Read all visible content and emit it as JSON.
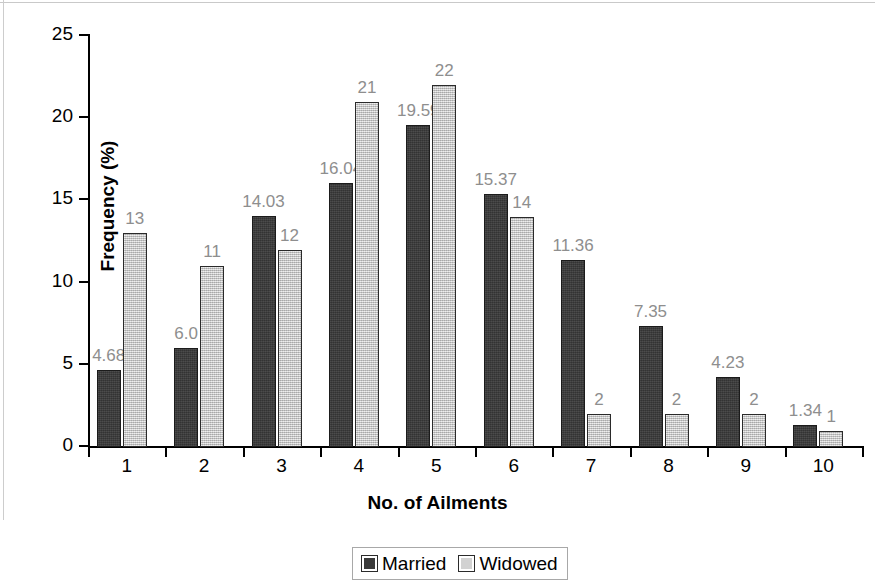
{
  "chart_data": {
    "type": "bar",
    "title": "",
    "xlabel": "No. of Ailments",
    "ylabel": "Frequency (%)",
    "categories": [
      "1",
      "2",
      "3",
      "4",
      "5",
      "6",
      "7",
      "8",
      "9",
      "10"
    ],
    "ylim": [
      0,
      25
    ],
    "yticks": [
      "0",
      "5",
      "10",
      "15",
      "20",
      "25"
    ],
    "grid": false,
    "legend_position": "bottom-center",
    "series": [
      {
        "name": "Married",
        "color": "#3a3a3a",
        "values": [
          4.68,
          6.01,
          14.03,
          16.04,
          19.59,
          15.37,
          11.36,
          7.35,
          4.23,
          1.34
        ],
        "labels": [
          "4.68",
          "6.0",
          "14.03",
          "16.04",
          "19.59",
          "15.37",
          "11.36",
          "7.35",
          "4.23",
          "1.34"
        ]
      },
      {
        "name": "Widowed",
        "color": "#d2d2d2",
        "values": [
          13,
          11,
          12,
          21,
          22,
          14,
          2,
          2,
          2,
          1
        ],
        "labels": [
          "13",
          "11",
          "12",
          "21",
          "22",
          "14",
          "2",
          "2",
          "2",
          "1"
        ]
      }
    ]
  },
  "legend": {
    "married_label": "Married",
    "widowed_label": "Widowed"
  }
}
